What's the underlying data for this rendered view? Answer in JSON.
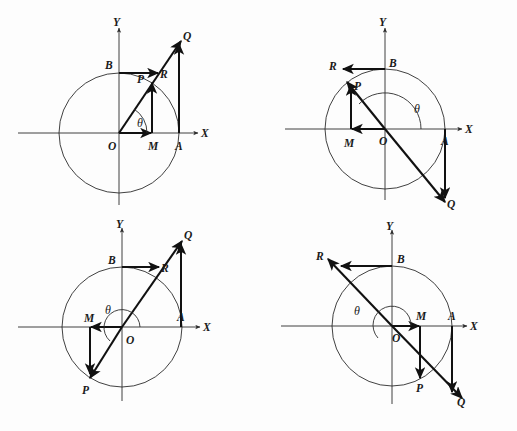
{
  "figure": {
    "background_color": "#fdfdfd",
    "ink_color": "#111111",
    "axis_color": "#2b2b2b",
    "panel_count": 4
  },
  "labels": {
    "x_axis": "X",
    "y_axis": "Y",
    "origin": "O",
    "point_a": "A",
    "point_b": "B",
    "point_p": "P",
    "point_q": "Q",
    "point_r": "R",
    "point_m": "M",
    "angle": "θ"
  },
  "panels": [
    {
      "name": "quadrant-1",
      "index": 1,
      "angle_label": "θ",
      "angle_degrees": 57,
      "quadrant": "first",
      "points": [
        "O",
        "A",
        "B",
        "M",
        "P",
        "Q",
        "R"
      ],
      "axis_labels": {
        "x": "X",
        "y": "Y"
      },
      "point_labels": {
        "O": "O",
        "A": "A",
        "B": "B",
        "M": "M",
        "P": "P",
        "Q": "Q",
        "R": "R",
        "theta": "θ"
      }
    },
    {
      "name": "quadrant-2",
      "index": 2,
      "angle_label": "θ",
      "angle_degrees": 125,
      "quadrant": "second",
      "points": [
        "O",
        "A",
        "B",
        "M",
        "P",
        "Q",
        "R"
      ],
      "axis_labels": {
        "x": "X",
        "y": "Y"
      },
      "point_labels": {
        "O": "O",
        "A": "A",
        "B": "B",
        "M": "M",
        "P": "P",
        "Q": "Q",
        "R": "R",
        "theta": "θ"
      }
    },
    {
      "name": "quadrant-3",
      "index": 3,
      "angle_label": "θ",
      "angle_degrees": 237,
      "quadrant": "third",
      "points": [
        "O",
        "A",
        "B",
        "M",
        "P",
        "Q",
        "R"
      ],
      "axis_labels": {
        "x": "X",
        "y": "Y"
      },
      "point_labels": {
        "O": "O",
        "A": "A",
        "B": "B",
        "M": "M",
        "P": "P",
        "Q": "Q",
        "R": "R",
        "theta": "θ"
      }
    },
    {
      "name": "quadrant-4",
      "index": 4,
      "angle_label": "θ",
      "angle_degrees": 303,
      "quadrant": "fourth",
      "points": [
        "O",
        "A",
        "B",
        "M",
        "P",
        "Q",
        "R"
      ],
      "axis_labels": {
        "x": "X",
        "y": "Y"
      },
      "point_labels": {
        "O": "O",
        "A": "A",
        "B": "B",
        "M": "M",
        "P": "P",
        "Q": "Q",
        "R": "R",
        "theta": "θ"
      }
    }
  ]
}
